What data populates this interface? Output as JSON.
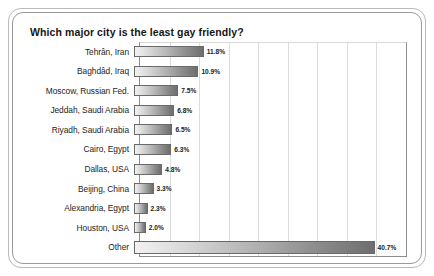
{
  "chart_data": {
    "type": "bar",
    "orientation": "horizontal",
    "title": "Which major city is the least gay friendly?",
    "xlabel": "",
    "ylabel": "",
    "xlim": [
      0,
      45
    ],
    "grid": true,
    "gridlines": [
      5,
      10,
      15,
      20,
      25,
      30,
      35,
      40
    ],
    "legend": "none",
    "value_suffix": "%",
    "categories": [
      "Tehrân, Iran",
      "Baghdâd, Iraq",
      "Moscow, Russian Fed.",
      "Jeddah, Saudi Arabia",
      "Riyadh, Saudi Arabia",
      "Cairo, Egypt",
      "Dallas, USA",
      "Beijing, China",
      "Alexandria, Egypt",
      "Houston, USA",
      "Other"
    ],
    "values": [
      11.8,
      10.9,
      7.5,
      6.8,
      6.5,
      6.3,
      4.8,
      3.3,
      2.3,
      2.0,
      40.7
    ],
    "value_labels": [
      "11.8%",
      "10.9%",
      "7.5%",
      "6.8%",
      "6.5%",
      "6.3%",
      "4.8%",
      "3.3%",
      "2.3%",
      "2.0%",
      "40.7%"
    ],
    "colors": {
      "bar_gradient_start": "#f2f2f2",
      "bar_gradient_end": "#6e6e6e",
      "bar_border": "#6a6a6a",
      "gridline": "#dcdcdc",
      "axis": "#8d8d8d",
      "text": "#1d1d1d",
      "title": "#161616",
      "frame_outer": "#b9b9b9",
      "frame_inner": "#9a9a9a",
      "background": "#ffffff"
    }
  }
}
